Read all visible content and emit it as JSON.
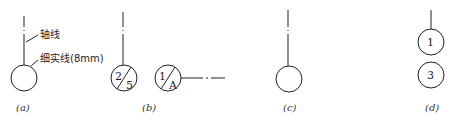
{
  "figures": {
    "a": {
      "caption": "(a)",
      "label_axis": "轴线",
      "label_line": "细实线(8mm)"
    },
    "b": {
      "caption": "(b)",
      "circle1": {
        "top": "2",
        "bottom": "5"
      },
      "circle2": {
        "top": "1",
        "bottom": "A"
      }
    },
    "c": {
      "caption": "(c)"
    },
    "d": {
      "caption": "(d)",
      "circle_top": "1",
      "circle_bottom": "3"
    }
  },
  "colors": {
    "stroke": "#222222",
    "background": "#ffffff"
  }
}
